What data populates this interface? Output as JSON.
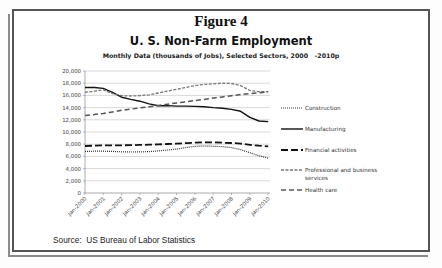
{
  "figure_label": "Figure 4",
  "source_text": "Source:  US Bureau of Labor Statistics",
  "chart_data": {
    "type": "line",
    "title": "U. S. Non-Farm Employment",
    "subtitle": "Monthly Data (thousands of Jobs), Selected Sectors, 2000   -2010p",
    "xlabel": "",
    "ylabel": "",
    "ylim": [
      0,
      20000
    ],
    "yticks": [
      0,
      2000,
      4000,
      6000,
      8000,
      10000,
      12000,
      14000,
      16000,
      18000,
      20000
    ],
    "ytick_labels": [
      "0",
      "2,000",
      "4,000",
      "6,000",
      "8,000",
      "10,000",
      "12,000",
      "14,000",
      "16,000",
      "18,000",
      "20,000"
    ],
    "xtick_labels": [
      "Jan-2000",
      "Jan-2001",
      "Jan-2002",
      "Jan-2003",
      "Jan-2004",
      "Jan-2005",
      "Jan-2006",
      "Jan-2007",
      "Jan-2008",
      "Jan-2009",
      "Jan-2010"
    ],
    "x": [
      2000.0,
      2000.5,
      2001.0,
      2001.5,
      2002.0,
      2002.5,
      2003.0,
      2003.5,
      2004.0,
      2004.5,
      2005.0,
      2005.5,
      2006.0,
      2006.5,
      2007.0,
      2007.5,
      2008.0,
      2008.5,
      2009.0,
      2009.5,
      2010.0
    ],
    "xlim": [
      2000.0,
      2010.1
    ],
    "grid": "horizontal",
    "legend_position": "right",
    "series": [
      {
        "name": "Construction",
        "style": "dotted",
        "values": [
          6800,
          6850,
          6850,
          6820,
          6750,
          6720,
          6730,
          6780,
          6900,
          7050,
          7200,
          7450,
          7650,
          7700,
          7650,
          7600,
          7450,
          7100,
          6600,
          6100,
          5700
        ]
      },
      {
        "name": "Manufacturing",
        "style": "solid",
        "values": [
          17300,
          17300,
          17150,
          16500,
          15700,
          15350,
          15050,
          14600,
          14300,
          14330,
          14250,
          14240,
          14200,
          14150,
          14000,
          13900,
          13700,
          13400,
          12400,
          11800,
          11700
        ]
      },
      {
        "name": "Financial activities",
        "style": "long-dash",
        "values": [
          7700,
          7750,
          7800,
          7800,
          7820,
          7830,
          7880,
          7920,
          7970,
          8030,
          8100,
          8180,
          8250,
          8300,
          8300,
          8250,
          8200,
          8100,
          7900,
          7750,
          7650
        ]
      },
      {
        "name": "Professional and business services",
        "style": "short-dash",
        "values": [
          16500,
          16700,
          16900,
          16300,
          15950,
          15900,
          15950,
          16100,
          16400,
          16700,
          17000,
          17300,
          17600,
          17800,
          17900,
          18000,
          17950,
          17600,
          16800,
          16600,
          16600
        ]
      },
      {
        "name": "Health care",
        "style": "dashed",
        "values": [
          12700,
          12850,
          13050,
          13300,
          13550,
          13750,
          13950,
          14150,
          14350,
          14550,
          14750,
          14950,
          15150,
          15350,
          15550,
          15750,
          15950,
          16150,
          16300,
          16450,
          16550
        ]
      }
    ]
  }
}
